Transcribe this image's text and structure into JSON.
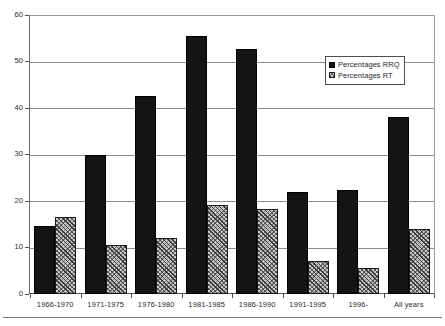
{
  "chart_data": {
    "type": "bar",
    "title": "",
    "subtitle": "",
    "xlabel": "",
    "ylabel": "",
    "ylim": [
      0,
      60
    ],
    "ytick_values": [
      0,
      10,
      20,
      30,
      40,
      50,
      60
    ],
    "ytick_labels": [
      "0",
      "10",
      "20",
      "30",
      "40",
      "50",
      "60"
    ],
    "grid": true,
    "grid_axis": "y",
    "legend_position": "upper-right-inside",
    "categories": [
      "1966-1970",
      "1971-1975",
      "1976-1980",
      "1981-1985",
      "1986-1990",
      "1991-1995",
      "1996-",
      "All years"
    ],
    "series": [
      {
        "name": "Percentages RRQ",
        "style": "solid-black",
        "color": "#141414",
        "values": [
          14.6,
          29.9,
          42.7,
          55.7,
          52.9,
          22.1,
          22.5,
          38.2
        ]
      },
      {
        "name": "Percentages RT",
        "style": "hatched-gray",
        "color": "#c9c9c9",
        "values": [
          16.6,
          10.6,
          12.0,
          19.2,
          18.4,
          7.1,
          5.6,
          14.0
        ]
      }
    ]
  },
  "legend": {
    "items": [
      {
        "label": "Percentages RRQ",
        "swatch": "solid"
      },
      {
        "label": "Percentages RT",
        "swatch": "hatch"
      }
    ]
  }
}
